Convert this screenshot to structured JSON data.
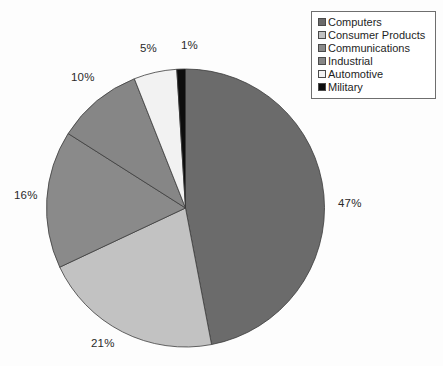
{
  "chart_data": {
    "type": "pie",
    "title": "",
    "categories": [
      "Computers",
      "Consumer Products",
      "Communications",
      "Industrial",
      "Automotive",
      "Military"
    ],
    "values": [
      47,
      21,
      16,
      10,
      5,
      1
    ],
    "value_labels": [
      "47%",
      "21%",
      "16%",
      "10%",
      "5%",
      "1%"
    ],
    "unit": "percent",
    "start_angle_deg": 0,
    "direction": "clockwise",
    "legend_position": "top-right",
    "grid": false,
    "colors": [
      "#6b6b6b",
      "#c2c2c2",
      "#8a8a8a",
      "#868686",
      "#f2f2f2",
      "#0d0d0d"
    ],
    "labels_outside": true
  },
  "legend": {
    "items": [
      {
        "label": "Computers",
        "color": "#6b6b6b"
      },
      {
        "label": "Consumer Products",
        "color": "#c2c2c2"
      },
      {
        "label": "Communications",
        "color": "#8a8a8a"
      },
      {
        "label": "Industrial",
        "color": "#868686"
      },
      {
        "label": "Automotive",
        "color": "#f2f2f2"
      },
      {
        "label": "Military",
        "color": "#0d0d0d"
      }
    ]
  },
  "labels": {
    "computers": "47%",
    "consumer_products": "21%",
    "communications": "16%",
    "industrial": "10%",
    "automotive": "5%",
    "military": "1%"
  }
}
